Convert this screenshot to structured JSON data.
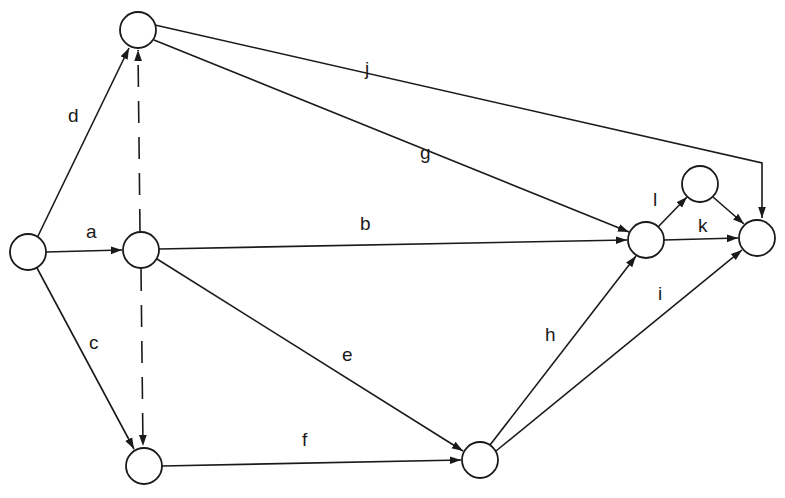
{
  "diagram": {
    "type": "activity-on-arrow network",
    "colors": {
      "stroke": "#1a1a1a",
      "background": "#ffffff"
    },
    "nodes": [
      {
        "id": "n_start",
        "x": 28,
        "y": 252,
        "r": 18
      },
      {
        "id": "n_top",
        "x": 138,
        "y": 30,
        "r": 18
      },
      {
        "id": "n_mid",
        "x": 141,
        "y": 250,
        "r": 18
      },
      {
        "id": "n_low",
        "x": 144,
        "y": 466,
        "r": 18
      },
      {
        "id": "n_f_end",
        "x": 480,
        "y": 460,
        "r": 18
      },
      {
        "id": "n_b_end",
        "x": 646,
        "y": 240,
        "r": 18
      },
      {
        "id": "n_l_end",
        "x": 700,
        "y": 184,
        "r": 18
      },
      {
        "id": "n_finish",
        "x": 757,
        "y": 238,
        "r": 18
      }
    ],
    "edges": [
      {
        "label": "a",
        "from": "n_start",
        "to": "n_mid",
        "style": "solid"
      },
      {
        "label": "d",
        "from": "n_start",
        "to": "n_top",
        "style": "solid"
      },
      {
        "label": "c",
        "from": "n_start",
        "to": "n_low",
        "style": "solid"
      },
      {
        "label": "b",
        "from": "n_mid",
        "to": "n_b_end",
        "style": "solid"
      },
      {
        "label": "e",
        "from": "n_mid",
        "to": "n_f_end",
        "style": "solid"
      },
      {
        "label": "g",
        "from": "n_top",
        "to": "n_b_end",
        "style": "solid"
      },
      {
        "label": "j",
        "from": "n_top",
        "to": "n_finish",
        "style": "solid",
        "via": [
          762,
          163
        ]
      },
      {
        "label": "f",
        "from": "n_low",
        "to": "n_f_end",
        "style": "solid"
      },
      {
        "label": "h",
        "from": "n_f_end",
        "to": "n_b_end",
        "style": "solid"
      },
      {
        "label": "i",
        "from": "n_f_end",
        "to": "n_finish",
        "style": "solid"
      },
      {
        "label": "l",
        "from": "n_b_end",
        "to": "n_l_end",
        "style": "solid"
      },
      {
        "label": "k",
        "from": "n_b_end",
        "to": "n_finish",
        "style": "solid"
      },
      {
        "label": "",
        "from": "n_l_end",
        "to": "n_finish",
        "style": "solid"
      },
      {
        "label": "",
        "from": "n_mid",
        "to": "n_top",
        "style": "dashed",
        "kind": "dummy"
      },
      {
        "label": "",
        "from": "n_mid",
        "to": "n_low",
        "style": "dashed",
        "kind": "dummy"
      }
    ],
    "labels": {
      "a": "a",
      "b": "b",
      "c": "c",
      "d": "d",
      "e": "e",
      "f": "f",
      "g": "g",
      "h": "h",
      "i": "i",
      "j": "j",
      "k": "k",
      "l": "l"
    }
  }
}
